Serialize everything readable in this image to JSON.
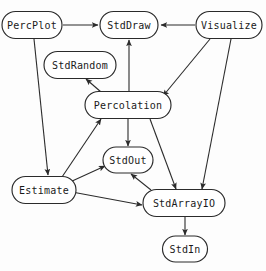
{
  "diagram": {
    "type": "directed-graph",
    "style": {
      "background": "#fdfdfd",
      "node_fill": "#ffffff",
      "node_stroke": "#2b2b2b",
      "edge_stroke": "#2b2b2b",
      "label_color": "#1a1a1a"
    },
    "nodes": [
      {
        "id": "PercPlot",
        "label": "PercPlot",
        "cx": 32,
        "cy": 25,
        "w": 60,
        "h": 27
      },
      {
        "id": "StdDraw",
        "label": "StdDraw",
        "cx": 129,
        "cy": 25,
        "w": 58,
        "h": 27
      },
      {
        "id": "Visualize",
        "label": "Visualize",
        "cx": 229,
        "cy": 25,
        "w": 66,
        "h": 27
      },
      {
        "id": "StdRandom",
        "label": "StdRandom",
        "cx": 80,
        "cy": 65,
        "w": 72,
        "h": 27
      },
      {
        "id": "Percolation",
        "label": "Percolation",
        "cx": 128,
        "cy": 105,
        "w": 86,
        "h": 27
      },
      {
        "id": "StdOut",
        "label": "StdOut",
        "cx": 128,
        "cy": 160,
        "w": 50,
        "h": 26
      },
      {
        "id": "Estimate",
        "label": "Estimate",
        "cx": 44,
        "cy": 190,
        "w": 64,
        "h": 27
      },
      {
        "id": "StdArrayIO",
        "label": "StdArrayIO",
        "cx": 184,
        "cy": 203,
        "w": 82,
        "h": 27
      },
      {
        "id": "StdIn",
        "label": "StdIn",
        "cx": 185,
        "cy": 249,
        "w": 45,
        "h": 26
      }
    ],
    "edges": [
      {
        "from": "PercPlot",
        "to": "StdDraw",
        "x1": 63,
        "y1": 25,
        "x2": 98,
        "y2": 25
      },
      {
        "from": "Visualize",
        "to": "StdDraw",
        "x1": 195,
        "y1": 25,
        "x2": 161,
        "y2": 25
      },
      {
        "from": "PercPlot",
        "to": "Estimate",
        "x1": 34,
        "y1": 39,
        "x2": 48,
        "y2": 175
      },
      {
        "from": "Percolation",
        "to": "StdRandom",
        "x1": 101,
        "y1": 92,
        "x2": 86,
        "y2": 79
      },
      {
        "from": "Percolation",
        "to": "StdDraw",
        "x1": 129,
        "y1": 92,
        "x2": 129,
        "y2": 40
      },
      {
        "from": "Visualize",
        "to": "Percolation",
        "x1": 210,
        "y1": 39,
        "x2": 163,
        "y2": 96
      },
      {
        "from": "Estimate",
        "to": "Percolation",
        "x1": 62,
        "y1": 177,
        "x2": 101,
        "y2": 119
      },
      {
        "from": "Percolation",
        "to": "StdOut",
        "x1": 128,
        "y1": 119,
        "x2": 128,
        "y2": 146
      },
      {
        "from": "Percolation",
        "to": "StdArrayIO",
        "x1": 150,
        "y1": 119,
        "x2": 176,
        "y2": 189
      },
      {
        "from": "Visualize",
        "to": "StdArrayIO",
        "x1": 231,
        "y1": 39,
        "x2": 202,
        "y2": 189
      },
      {
        "from": "Estimate",
        "to": "StdOut",
        "x1": 70,
        "y1": 182,
        "x2": 105,
        "y2": 166
      },
      {
        "from": "Estimate",
        "to": "StdArrayIO",
        "x1": 72,
        "y1": 192,
        "x2": 142,
        "y2": 205
      },
      {
        "from": "StdArrayIO",
        "to": "StdOut",
        "x1": 151,
        "y1": 190,
        "x2": 131,
        "y2": 174
      },
      {
        "from": "StdArrayIO",
        "to": "StdIn",
        "x1": 185,
        "y1": 217,
        "x2": 185,
        "y2": 235
      }
    ]
  }
}
